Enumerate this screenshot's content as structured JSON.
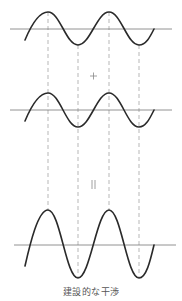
{
  "diagram": {
    "type": "wave-superposition",
    "caption": "建設的な干渉",
    "operators": {
      "plus": "+",
      "equals": "||"
    },
    "colors": {
      "wave": "#2a2a2a",
      "axis": "#777777",
      "guide": "#999999",
      "operator": "#888888"
    },
    "waves": [
      {
        "name": "wave-1",
        "axis_y": 29,
        "amplitude": 17
      },
      {
        "name": "wave-2",
        "axis_y": 110,
        "amplitude": 17
      },
      {
        "name": "sum-wave",
        "axis_y": 245,
        "amplitude": 34
      }
    ],
    "guide_lines_x": [
      48,
      78,
      109,
      139
    ]
  }
}
